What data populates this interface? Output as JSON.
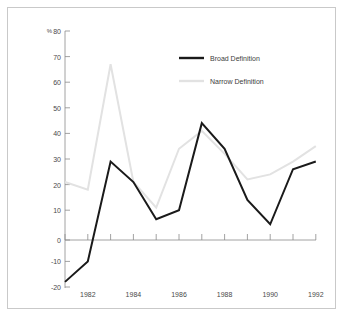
{
  "chart_data": {
    "type": "line",
    "title": "",
    "subtitle": "",
    "xlabel": "",
    "ylabel": "",
    "unit_label": "%",
    "x": [
      1981,
      1982,
      1983,
      1984,
      1985,
      1986,
      1987,
      1988,
      1989,
      1990,
      1991,
      1992
    ],
    "xlim": [
      1981,
      1992
    ],
    "ylim": [
      -20,
      80
    ],
    "yticks": [
      -20,
      -10,
      0,
      10,
      20,
      30,
      40,
      50,
      60,
      70,
      80
    ],
    "ytick_labels": [
      "-20",
      "-10",
      "0",
      "10",
      "20",
      "30",
      "40",
      "50",
      "60",
      "70",
      "80"
    ],
    "xticks": [
      1981,
      1982,
      1983,
      1984,
      1985,
      1986,
      1987,
      1988,
      1989,
      1990,
      1991,
      1992
    ],
    "xtick_labels": [
      "",
      "1982",
      "",
      "1984",
      "",
      "1986",
      "",
      "1988",
      "",
      "1990",
      "",
      "1992"
    ],
    "grid": false,
    "legend_position": "upper-center-right",
    "zero_line": 0,
    "series": [
      {
        "name": "Broad Definition",
        "color": "#1a1a1a",
        "width": 2.0,
        "values": [
          -18,
          -10,
          29,
          21,
          6.5,
          10,
          44,
          34,
          14,
          4.5,
          26,
          29
        ]
      },
      {
        "name": "Narrow Definition",
        "color": "#e2e2e2",
        "width": 2.0,
        "values": [
          21,
          18,
          67,
          21,
          11,
          34,
          41,
          32,
          22,
          24,
          29,
          35
        ]
      }
    ]
  },
  "legend": {
    "entries": [
      {
        "label": "Broad Definition",
        "color": "#1a1a1a"
      },
      {
        "label": "Narrow Definition",
        "color": "#e2e2e2"
      }
    ]
  },
  "axes": {
    "unit": "%",
    "y_labels": [
      "80",
      "70",
      "60",
      "50",
      "40",
      "30",
      "20",
      "10",
      "0",
      "-10",
      "-20"
    ],
    "x_labels": [
      "1982",
      "1984",
      "1986",
      "1988",
      "1990",
      "1992"
    ]
  },
  "colors": {
    "broad": "#1a1a1a",
    "narrow": "#e2e2e2",
    "axis": "#8a8a8a",
    "text": "#4a4a4a",
    "border": "#c9c9c9",
    "background": "#ffffff"
  }
}
